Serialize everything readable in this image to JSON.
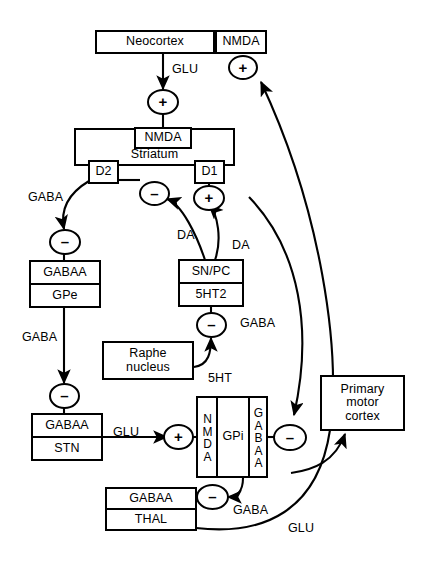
{
  "diagram": {
    "stroke_color": "#000000",
    "background_color": "#ffffff"
  },
  "boxes": {
    "neocortex": {
      "label": "Neocortex"
    },
    "nmda_top": {
      "label": "NMDA"
    },
    "nmda_striatum": {
      "label": "NMDA"
    },
    "striatum": {
      "label": "Striatum"
    },
    "d2": {
      "label": "D2"
    },
    "d1": {
      "label": "D1"
    },
    "gpe": {
      "receptor": "GABAA",
      "region": "GPe"
    },
    "snpc": {
      "region": "SN/PC",
      "receptor": "5HT2"
    },
    "raphe": {
      "line1": "Raphe",
      "line2": "nucleus"
    },
    "stn": {
      "receptor": "GABAA",
      "region": "STN"
    },
    "gpi": {
      "left": "NMDA",
      "center": "GPi",
      "right": "GABAA"
    },
    "thal": {
      "receptor": "GABAA",
      "region": "THAL"
    },
    "motor_cortex": {
      "line1": "Primary",
      "line2": "motor",
      "line3": "cortex"
    }
  },
  "nodes": {
    "plus_nmda_top": {
      "sign": "+"
    },
    "plus_striatum": {
      "sign": "+"
    },
    "minus_d2_d1": {
      "sign": "–"
    },
    "plus_d1": {
      "sign": "+"
    },
    "minus_gpe": {
      "sign": "–"
    },
    "minus_snpc": {
      "sign": "–"
    },
    "minus_stn": {
      "sign": "–"
    },
    "plus_gpi": {
      "sign": "+"
    },
    "minus_gpi_out": {
      "sign": "–"
    },
    "minus_thal": {
      "sign": "–"
    }
  },
  "edge_labels": {
    "glu_cortex": "GLU",
    "gaba_d2": "GABA",
    "da_left": "DA",
    "da_right": "DA",
    "gaba_snpc": "GABA",
    "gaba_gpe": "GABA",
    "sht_raphe": "5HT",
    "glu_stn": "GLU",
    "gaba_thal": "GABA",
    "glu_thal": "GLU"
  }
}
